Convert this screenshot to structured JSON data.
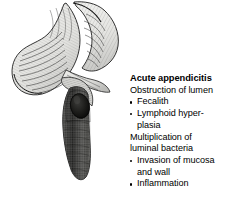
{
  "figure": {
    "name": "acute-appendicitis-illustration",
    "background_color": "#ffffff"
  },
  "illustration": {
    "alt": "Cut-away anatomical drawing of the cecum, terminal ileum and an inflamed appendix containing a fecalith",
    "parts": [
      {
        "name": "ascending-colon",
        "label": "Ascending colon",
        "fill": "#e8e8e6"
      },
      {
        "name": "cecum",
        "label": "Cecum",
        "fill": "#eaeae8"
      },
      {
        "name": "terminal-ileum",
        "label": "Terminal ileum",
        "fill": "#e5e5e3"
      },
      {
        "name": "appendix",
        "label": "Inflamed appendix",
        "fill": "#6e6e6c"
      },
      {
        "name": "fecalith",
        "label": "Fecalith",
        "fill": "#161616"
      }
    ],
    "colors": {
      "tissue_light": "#eaeae8",
      "tissue_mid": "#cfcfcc",
      "hatching": "#3a3a3a",
      "outline": "#1a1a1a",
      "appendix_wall": "#6e6e6c",
      "appendix_dark": "#3c3c3a",
      "fecalith": "#161616"
    }
  },
  "caption": {
    "title": "Acute appendicitis",
    "lines": [
      {
        "type": "plain",
        "text": "Obstruction of lumen"
      },
      {
        "type": "bullet",
        "text": "Fecalith"
      },
      {
        "type": "bullet",
        "text": "Lymphoid hyper-"
      },
      {
        "type": "cont",
        "text": "plasia"
      },
      {
        "type": "plain",
        "text": "Multiplication of"
      },
      {
        "type": "plain",
        "text": "luminal bacteria"
      },
      {
        "type": "bullet",
        "text": "Invasion of mucosa"
      },
      {
        "type": "cont",
        "text": "and wall"
      },
      {
        "type": "bullet",
        "text": "Inflammation"
      }
    ],
    "text_color": "#000000"
  }
}
